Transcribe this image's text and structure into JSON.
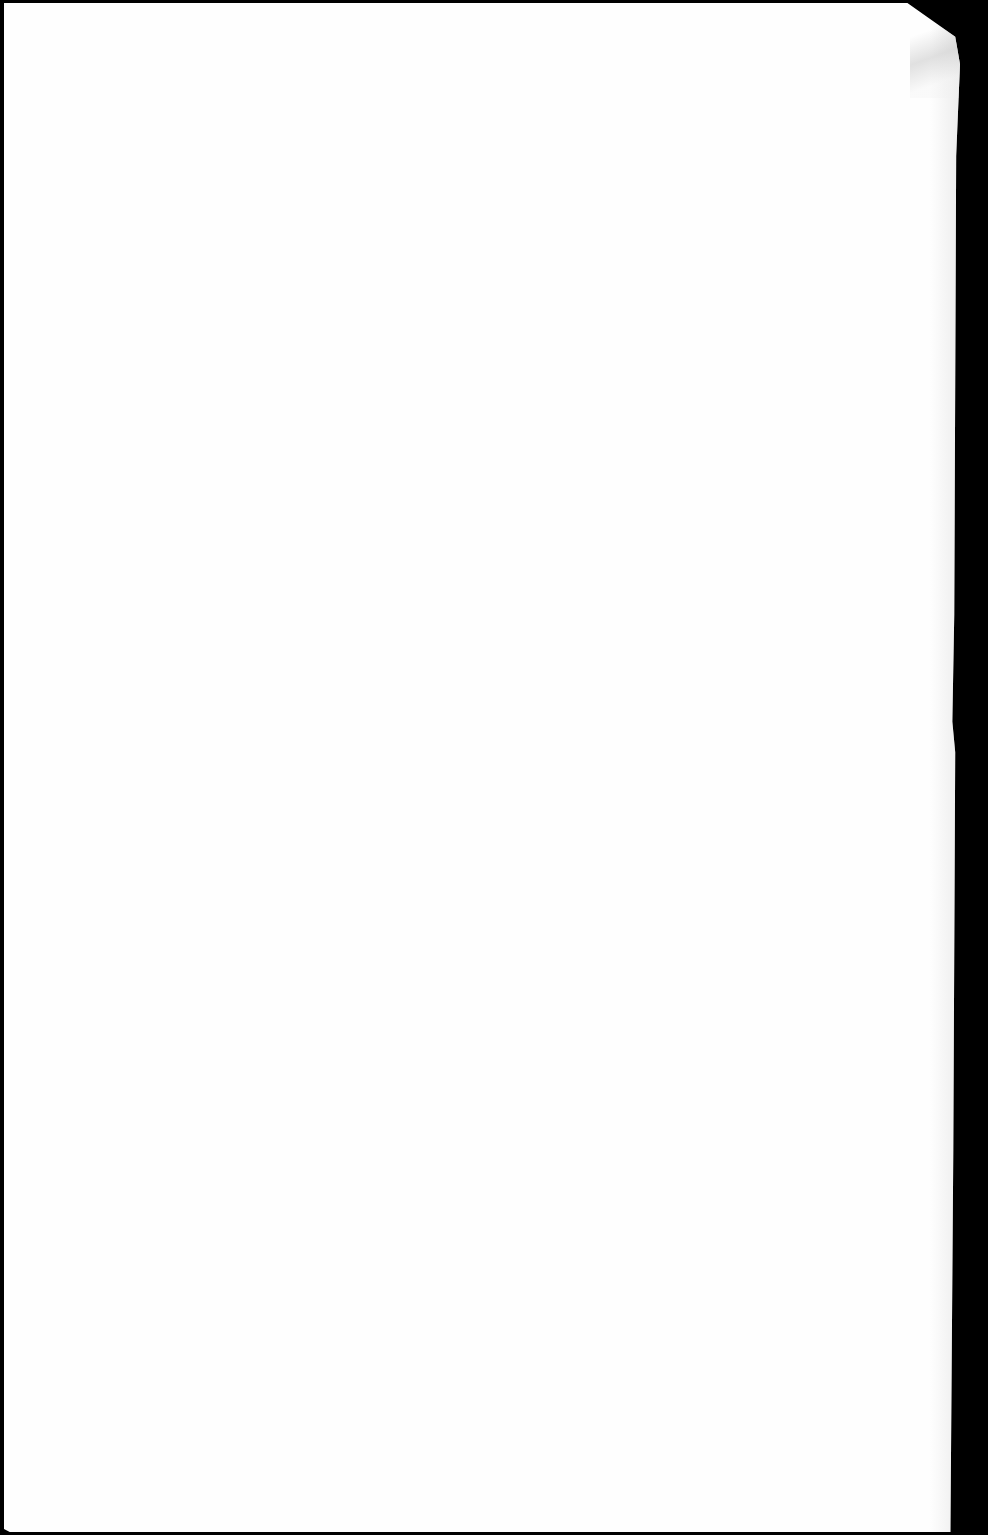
{
  "document": {
    "type": "scanned-page",
    "content": "",
    "page_background": "#fefefe",
    "scan_background": "#000000"
  }
}
